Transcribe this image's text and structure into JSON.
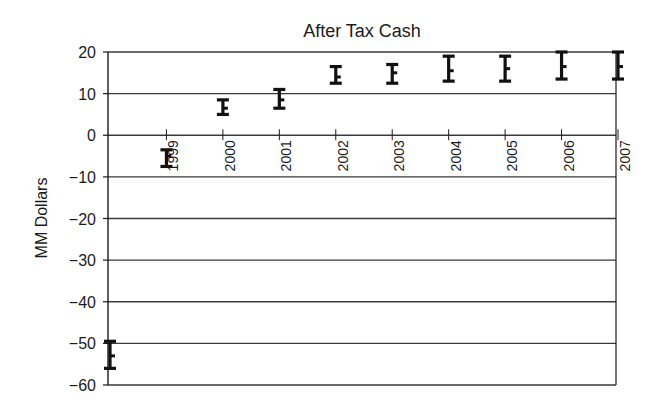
{
  "chart_data": {
    "type": "errorbar",
    "title": "After Tax Cash",
    "xlabel": "",
    "ylabel": "MM Dollars",
    "ylim": [
      -60,
      20
    ],
    "yticks": [
      20,
      10,
      0,
      -10,
      -20,
      -30,
      -40,
      -50,
      -60
    ],
    "ytick_labels": [
      "20",
      "10",
      "0",
      "−10",
      "−20",
      "−30",
      "−40",
      "−50",
      "−60"
    ],
    "grid": "horizontal",
    "legend": null,
    "categories": [
      "1998",
      "1999",
      "2000",
      "2001",
      "2002",
      "2003",
      "2004",
      "2005",
      "2006",
      "2007"
    ],
    "x_tick_labels": [
      "",
      "1999",
      "2000",
      "2001",
      "2002",
      "2003",
      "2004",
      "2005",
      "2006",
      "2007"
    ],
    "series": [
      {
        "name": "After Tax Cash range",
        "high": [
          -49.5,
          -3.5,
          8.5,
          11,
          16.5,
          17,
          19,
          19,
          20,
          20
        ],
        "mid": [
          -53,
          -5,
          6.5,
          8.5,
          14,
          15,
          15.5,
          16,
          16.5,
          16.5
        ],
        "low": [
          -56,
          -7.5,
          5,
          6.5,
          12.5,
          12.5,
          13,
          13,
          13.5,
          13.5
        ]
      }
    ],
    "colors": {
      "line": "#1c1c1c",
      "grid": "#3a3a3a",
      "bar": "#111111",
      "background": "#ffffff"
    }
  }
}
